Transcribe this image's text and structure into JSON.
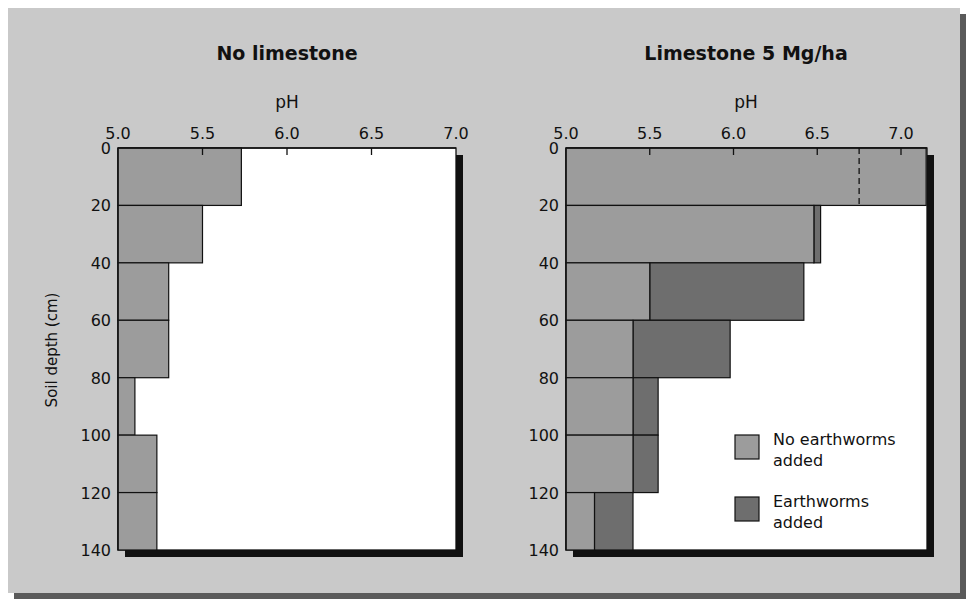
{
  "colors": {
    "background_panel": "#c9c9c9",
    "no_earthworms": "#9c9c9c",
    "earthworms": "#6e6e6e",
    "plot_bg": "#ffffff",
    "axis": "#111111"
  },
  "legend": {
    "items": [
      {
        "label_line1": "No earthworms",
        "label_line2": "added",
        "color": "#9c9c9c"
      },
      {
        "label_line1": "Earthworms",
        "label_line2": "added",
        "color": "#6e6e6e"
      }
    ]
  },
  "chart_data": [
    {
      "type": "bar",
      "orientation": "horizontal",
      "title": "No limestone",
      "xlabel": "pH",
      "ylabel": "Soil depth (cm)",
      "xlim": [
        5.0,
        7.0
      ],
      "ylim": [
        0,
        140
      ],
      "xticks": [
        "5.0",
        "5.5",
        "6.0",
        "6.5",
        "7.0"
      ],
      "yticks": [
        "0",
        "20",
        "40",
        "60",
        "80",
        "100",
        "120",
        "140"
      ],
      "categories": [
        "0-20",
        "20-40",
        "40-60",
        "60-80",
        "80-100",
        "100-120",
        "120-140"
      ],
      "series": [
        {
          "name": "No earthworms added",
          "values": [
            5.73,
            5.5,
            5.3,
            5.3,
            5.1,
            5.23,
            5.23
          ]
        }
      ]
    },
    {
      "type": "bar",
      "orientation": "horizontal",
      "title": "Limestone 5 Mg/ha",
      "xlabel": "pH",
      "ylabel": "Soil depth (cm)",
      "xlim": [
        5.0,
        7.0
      ],
      "ylim": [
        0,
        140
      ],
      "xticks": [
        "5.0",
        "5.5",
        "6.0",
        "6.5",
        "7.0"
      ],
      "yticks": [
        "0",
        "20",
        "40",
        "60",
        "80",
        "100",
        "120",
        "140"
      ],
      "categories": [
        "0-20",
        "20-40",
        "40-60",
        "60-80",
        "80-100",
        "100-120",
        "120-140"
      ],
      "series": [
        {
          "name": "No earthworms added",
          "values": [
            7.15,
            6.48,
            5.5,
            5.4,
            5.4,
            5.4,
            5.17
          ]
        },
        {
          "name": "Earthworms added",
          "values": [
            7.15,
            6.52,
            6.42,
            5.98,
            5.55,
            5.55,
            5.4
          ]
        }
      ],
      "annotations": [
        "Dashed divider at pH ~6.75 within 0-20 cm bar"
      ],
      "legend_position": "lower right inside plot"
    }
  ]
}
